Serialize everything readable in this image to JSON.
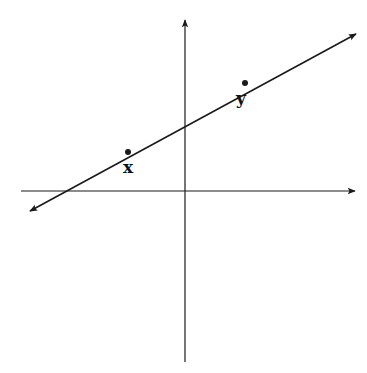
{
  "diagram": {
    "type": "coordinate-plane-with-line",
    "axes": {
      "x_axis": {
        "x1": 21,
        "y": 191,
        "x2": 355,
        "arrow": "right"
      },
      "y_axis": {
        "x": 185,
        "y1": 362,
        "y2": 20,
        "arrow": "up"
      }
    },
    "line": {
      "x1": 30,
      "y1": 211,
      "x2": 356,
      "y2": 34,
      "arrows": "both"
    },
    "points": [
      {
        "name": "x",
        "label": "x",
        "cx": 128,
        "cy": 152,
        "lx": 128,
        "ly": 173
      },
      {
        "name": "y",
        "label": "y",
        "cx": 245,
        "cy": 83,
        "lx": 241,
        "ly": 104
      }
    ],
    "colors": {
      "stroke": "#1a1a1a",
      "background": "#ffffff"
    }
  }
}
